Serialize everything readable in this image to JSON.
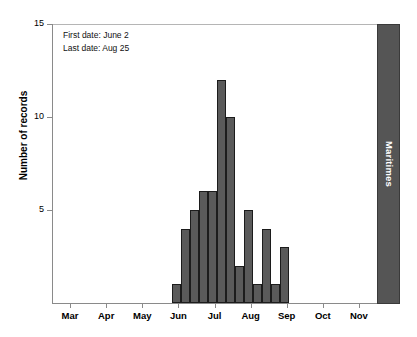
{
  "chart_data": {
    "type": "bar",
    "title": "",
    "subtitle": "",
    "xlabel": "",
    "ylabel": "Number of records",
    "ylim": [
      0,
      15
    ],
    "yticks": [
      5,
      10,
      15
    ],
    "ytick_labels": [
      "5",
      "10",
      "15"
    ],
    "xtick_labels": [
      "Mar",
      "Apr",
      "May",
      "Jun",
      "Jul",
      "Aug",
      "Sep",
      "Oct",
      "Nov"
    ],
    "grid": false,
    "legend": null,
    "bar_color": "#5a5a5a",
    "bar_edge_color": "#1c1c1c",
    "axis_color": "#8a8a8a",
    "panel_color": "#555555",
    "panel_label_color": "#ffffff",
    "categories": [
      "Jun 1",
      "Jun 8",
      "Jun 15",
      "Jun 22",
      "Jun 29",
      "Jul 6",
      "Jul 13",
      "Jul 20",
      "Jul 27",
      "Aug 3",
      "Aug 10",
      "Aug 17",
      "Aug 24"
    ],
    "values": [
      1,
      4,
      5,
      6,
      6,
      12,
      10,
      2,
      5,
      1,
      4,
      1,
      3
    ],
    "bars": [
      {
        "label": "Jun 1",
        "value": 1,
        "x": 172
      },
      {
        "label": "Jun 8",
        "value": 4,
        "x": 181
      },
      {
        "label": "Jun 15",
        "value": 5,
        "x": 190
      },
      {
        "label": "Jun 22",
        "value": 6,
        "x": 199
      },
      {
        "label": "Jun 29",
        "value": 6,
        "x": 208
      },
      {
        "label": "Jul 6",
        "value": 12,
        "x": 217
      },
      {
        "label": "Jul 13",
        "value": 10,
        "x": 226
      },
      {
        "label": "Jul 20",
        "value": 2,
        "x": 235
      },
      {
        "label": "Jul 27",
        "value": 5,
        "x": 244
      },
      {
        "label": "Aug 3",
        "value": 1,
        "x": 253
      },
      {
        "label": "Aug 10",
        "value": 4,
        "x": 262
      },
      {
        "label": "Aug 17",
        "value": 1,
        "x": 271
      },
      {
        "label": "Aug 24",
        "value": 3,
        "x": 280
      }
    ],
    "annotations": [
      "First date: June 2",
      "Last date: Aug 25"
    ]
  },
  "panel": {
    "label": "Maritimes"
  },
  "annotation": {
    "first_date_line": "First date: June 2",
    "last_date_line": "Last date: Aug 25"
  },
  "axes": {
    "y_label": "Number of records"
  }
}
